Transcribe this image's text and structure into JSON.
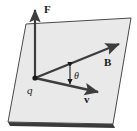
{
  "figure": {
    "caption": "",
    "background_color": "#ffffff",
    "plane": {
      "name": "reference-plane",
      "fill_color": "#e9e9e9",
      "stroke_color": "#4a4a4a",
      "shadow_color": "#3a3a3a",
      "points": "26,24 131,18 113,124 8,122"
    },
    "origin": {
      "label": "q",
      "x": 35,
      "y": 78,
      "dot_color": "#1a1a1a"
    },
    "vectors": [
      {
        "id": "force",
        "label": "F",
        "bold": true,
        "color": "#3d3d3d",
        "x1": 35,
        "y1": 78,
        "x2": 35,
        "y2": 7,
        "label_x": 44,
        "label_y": 13
      },
      {
        "id": "magnetic-field",
        "label": "B",
        "bold": true,
        "color": "#3d3d3d",
        "x1": 35,
        "y1": 78,
        "x2": 122,
        "y2": 43,
        "label_x": 104,
        "label_y": 66
      },
      {
        "id": "velocity",
        "label": "v",
        "bold": true,
        "color": "#3d3d3d",
        "x1": 35,
        "y1": 78,
        "x2": 101,
        "y2": 93,
        "label_x": 84,
        "label_y": 103
      }
    ],
    "angle": {
      "id": "theta",
      "label": "θ",
      "between": [
        "magnetic-field",
        "velocity"
      ],
      "marker_x": 70,
      "marker_y1": 64,
      "marker_y2": 86,
      "label_x": 74,
      "label_y": 78,
      "color": "#1a1a1a"
    }
  }
}
